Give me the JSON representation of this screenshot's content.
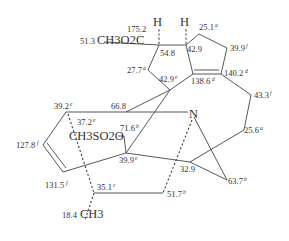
{
  "diagram": {
    "type": "chemical-structure-13C-NMR-assignments",
    "labels": {
      "c175": {
        "value": "175.2",
        "sup": ""
      },
      "ester_shift": "51.3",
      "ester_group": "CH3O2C",
      "h1": "H",
      "h2": "H",
      "c54": {
        "value": "54.8",
        "sup": ""
      },
      "c42a": {
        "value": "42.9",
        "sup": ""
      },
      "c25_1": {
        "value": "25.1",
        "sup": "a"
      },
      "c39_9f": {
        "value": "39.9",
        "sup": "f"
      },
      "c27_7": {
        "value": "27.7",
        "sup": "a"
      },
      "c42e": {
        "value": "42.9",
        "sup": "e"
      },
      "c138": {
        "value": "138.6",
        "sup": "d"
      },
      "c140": {
        "value": "140.2",
        "sup": "d"
      },
      "c43": {
        "value": "43.3",
        "sup": "f"
      },
      "c39_2": {
        "value": "39.2",
        "sup": "e"
      },
      "c66": {
        "value": "66.8",
        "sup": ""
      },
      "n": "N",
      "c37": {
        "value": "37.2",
        "sup": "e"
      },
      "mesyl": "CH3SO2O",
      "c71": {
        "value": "71.6",
        "sup": "b"
      },
      "c127": {
        "value": "127.8",
        "sup": "f"
      },
      "c25_6": {
        "value": "25.6",
        "sup": "a"
      },
      "c39_9e": {
        "value": "39.9",
        "sup": "e"
      },
      "c32": {
        "value": "32.9",
        "sup": ""
      },
      "c131": {
        "value": "131.5",
        "sup": "f"
      },
      "c63": {
        "value": "63.7",
        "sup": "b"
      },
      "c35": {
        "value": "35.1",
        "sup": "c"
      },
      "c51": {
        "value": "51.7",
        "sup": "b"
      },
      "methyl_shift": "18.4",
      "methyl": "CH3"
    }
  }
}
